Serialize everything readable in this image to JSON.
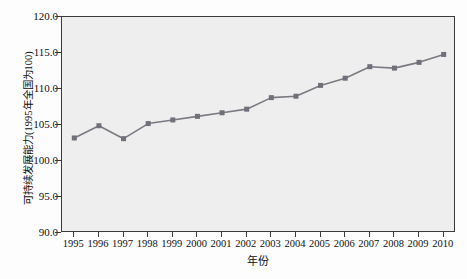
{
  "chart_data": {
    "type": "line",
    "title": "",
    "subtitle": "",
    "xlabel": "年份",
    "ylabel": "可持续发展能力(1995年全国为100)",
    "categories": [
      "1995",
      "1996",
      "1997",
      "1998",
      "1999",
      "2000",
      "2001",
      "2002",
      "2003",
      "2004",
      "2005",
      "2006",
      "2007",
      "2008",
      "2009",
      "2010"
    ],
    "x": [
      1995,
      1996,
      1997,
      1998,
      1999,
      2000,
      2001,
      2002,
      2003,
      2004,
      2005,
      2006,
      2007,
      2008,
      2009,
      2010
    ],
    "values": [
      103.2,
      104.9,
      103.1,
      105.2,
      105.7,
      106.2,
      106.7,
      107.2,
      108.8,
      109.0,
      110.5,
      111.5,
      113.1,
      112.9,
      113.7,
      114.8
    ],
    "series": [
      {
        "name": "可持续发展能力",
        "values": [
          103.2,
          104.9,
          103.1,
          105.2,
          105.7,
          106.2,
          106.7,
          107.2,
          108.8,
          109.0,
          110.5,
          111.5,
          113.1,
          112.9,
          113.7,
          114.8
        ]
      }
    ],
    "ylim": [
      90.0,
      120.0
    ],
    "xlim": [
      1995,
      2010
    ],
    "yticks": [
      "90.0",
      "95.0",
      "100.0",
      "105.0",
      "110.0",
      "115.0",
      "120.0"
    ],
    "ytick_values": [
      90.0,
      95.0,
      100.0,
      105.0,
      110.0,
      115.0,
      120.0
    ],
    "xticks": [
      "1995",
      "1996",
      "1997",
      "1998",
      "1999",
      "2000",
      "2001",
      "2002",
      "2003",
      "2004",
      "2005",
      "2006",
      "2007",
      "2008",
      "2009",
      "2010"
    ],
    "grid": false,
    "legend": false,
    "legend_position": "none",
    "marker": "square",
    "line_color": "#7a7a82",
    "marker_color": "#6f7079",
    "plot_background": "#eeeeee",
    "frame_color": "#3a3a3a",
    "annotations": []
  }
}
